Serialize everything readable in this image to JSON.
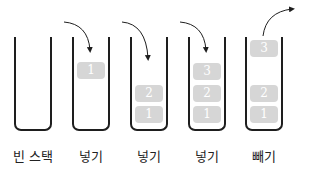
{
  "diagram": {
    "stacks": [
      {
        "label": "빈 스택",
        "blocks": []
      },
      {
        "label": "넣기",
        "blocks": [
          {
            "value": "1",
            "slot": "top-floating"
          }
        ]
      },
      {
        "label": "넣기",
        "blocks": [
          {
            "value": "2"
          },
          {
            "value": "1"
          }
        ]
      },
      {
        "label": "넣기",
        "blocks": [
          {
            "value": "3"
          },
          {
            "value": "2"
          },
          {
            "value": "1"
          }
        ]
      },
      {
        "label": "빼기",
        "blocks": [
          {
            "value": "3",
            "slot": "top-floating"
          },
          {
            "value": "2"
          },
          {
            "value": "1"
          }
        ]
      }
    ],
    "colors": {
      "block": "#d6d6d6",
      "outline": "#1e1e1e",
      "numeral": "#ffffff"
    }
  }
}
